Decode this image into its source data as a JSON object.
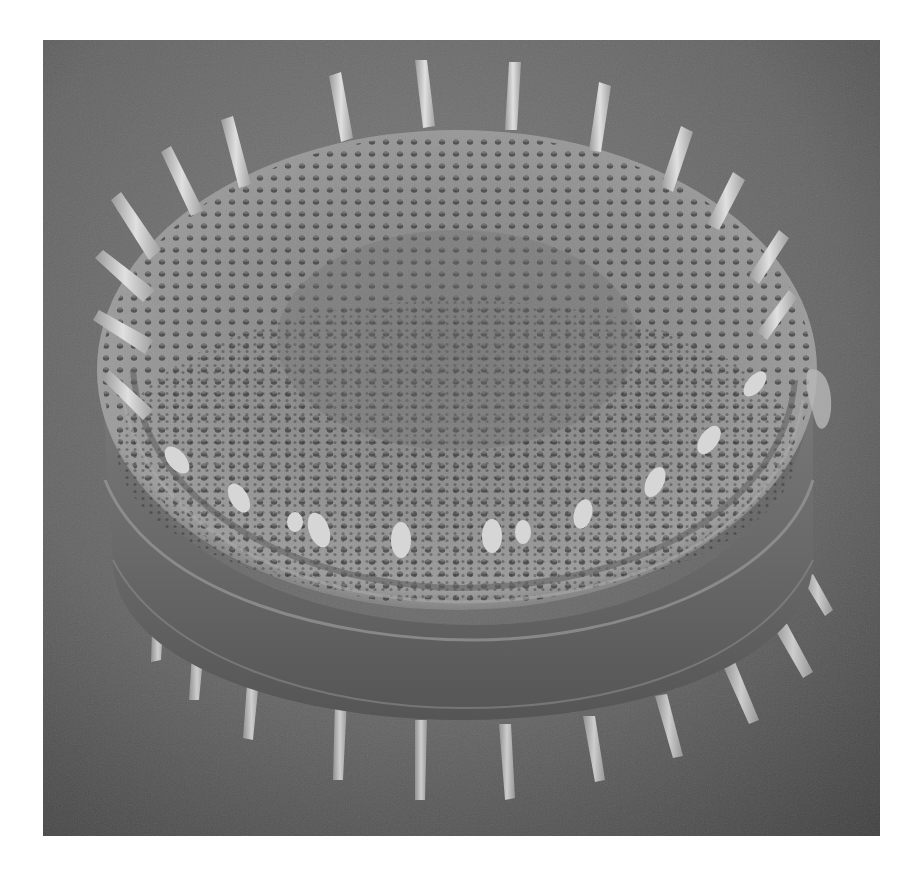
{
  "image": {
    "kind": "scanning electron micrograph",
    "subject": "centric diatom frustule with marginal spines",
    "colors": {
      "background_light": "#7a7a7a",
      "background_dark": "#3e3e3e",
      "valve_face": "#8a8a8a",
      "valve_pore": "#2e2e2e",
      "girdle_band": "#6e6e6e",
      "spine": "#d8d8d8",
      "page": "#ffffff"
    },
    "frame": {
      "left": 43,
      "top": 40,
      "width": 837,
      "height": 796
    }
  }
}
